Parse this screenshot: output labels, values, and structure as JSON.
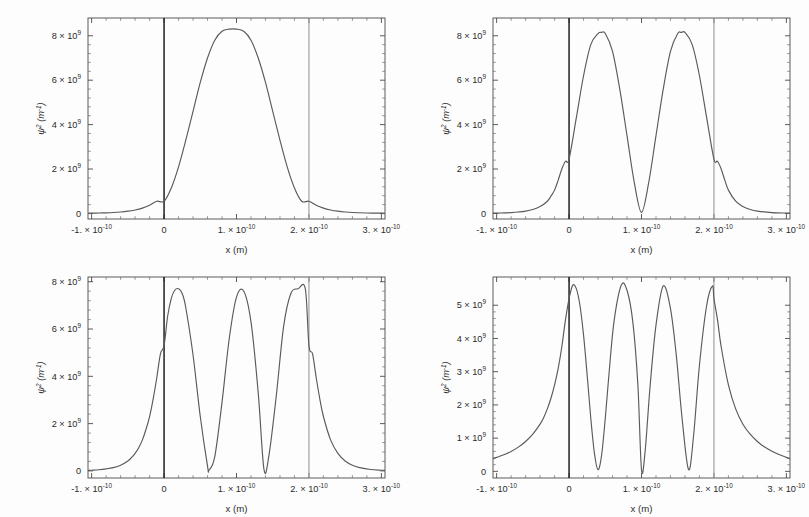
{
  "figure": {
    "background_color": "#fdfdfd",
    "curve_color": "#5a5a5a",
    "axis_color": "#4a4a4a",
    "well_wall_left_color": "#1f1f1f",
    "well_wall_right_color": "#9a9a9a",
    "rows": 2,
    "columns": 2
  },
  "axes": {
    "xlabel": "x (m)",
    "ylabel_base": "ψ",
    "ylabel_sup": "2",
    "ylabel_unit": "(m",
    "ylabel_unit_sup": "-1",
    "ylabel_unit_close": ")",
    "ylabel_full": "ψ² (m⁻¹)",
    "x_tick_labels": [
      "-1. × 10",
      "0",
      "1. × 10",
      "2. × 10",
      "3. × 10"
    ],
    "x_tick_exponents": [
      "-10",
      "",
      "-10",
      "-10",
      "-10"
    ],
    "x_tick_values": [
      -1e-10,
      0,
      1e-10,
      2e-10,
      3e-10
    ],
    "x_minor_per_interval": 4,
    "xlim": [
      -1.05e-10,
      3.05e-10
    ]
  },
  "chart_data": [
    {
      "id": "n1",
      "panel_position": "top-left",
      "type": "line",
      "title": "",
      "xlabel": "x (m)",
      "ylabel": "ψ² (m⁻¹)",
      "xlim": [
        -1.05e-10,
        3.05e-10
      ],
      "ylim": [
        -250000000.0,
        8800000000.0
      ],
      "grid": false,
      "legend": "none",
      "quantum_number": 1,
      "well_left_m": 0,
      "well_right_m": 2e-10,
      "peak_value": 8300000000.0,
      "peak_count": 1,
      "node_count": 0,
      "y_tick_labels": [
        "0",
        "2 × 10",
        "4 × 10",
        "6 × 10",
        "8 × 10"
      ],
      "y_tick_exponents": [
        "",
        "9",
        "9",
        "9",
        "9"
      ],
      "y_tick_values": [
        0,
        2000000000.0,
        4000000000.0,
        6000000000.0,
        8000000000.0
      ],
      "y_minor_per_interval": 4,
      "peaks_x_m": [
        1e-10
      ],
      "peaks_y": [
        8300000000.0
      ],
      "x": [
        -1.05e-10,
        -1e-10,
        -9e-11,
        -8e-11,
        -7e-11,
        -6e-11,
        -5e-11,
        -4e-11,
        -3e-11,
        -2e-11,
        -1e-11,
        0.0,
        1e-11,
        2e-11,
        3e-11,
        4e-11,
        5e-11,
        6e-11,
        7e-11,
        8e-11,
        9e-11,
        1e-10,
        1.1e-10,
        1.2e-10,
        1.3e-10,
        1.4e-10,
        1.5e-10,
        1.6e-10,
        1.7e-10,
        1.8e-10,
        1.9e-10,
        2e-10,
        2.1e-10,
        2.2e-10,
        2.3e-10,
        2.4e-10,
        2.5e-10,
        2.6e-10,
        2.8e-10,
        3e-10,
        3.05e-10
      ],
      "y": [
        10000000.0,
        12000000.0,
        18000000.0,
        28000000.0,
        43000000.0,
        66000000.0,
        102000000.0,
        157000000.0,
        240000000.0,
        370000000.0,
        550000000.0,
        550000000.0,
        1150000000.0,
        2100000000.0,
        3300000000.0,
        4600000000.0,
        5900000000.0,
        7000000000.0,
        7800000000.0,
        8200000000.0,
        8300000000.0,
        8300000000.0,
        8200000000.0,
        7800000000.0,
        7000000000.0,
        5900000000.0,
        4600000000.0,
        3300000000.0,
        2100000000.0,
        1150000000.0,
        550000000.0,
        550000000.0,
        370000000.0,
        240000000.0,
        157000000.0,
        102000000.0,
        66000000.0,
        43000000.0,
        22000000.0,
        12000000.0,
        10000000.0
      ]
    },
    {
      "id": "n2",
      "panel_position": "top-right",
      "type": "line",
      "title": "",
      "xlabel": "x (m)",
      "ylabel": "ψ² (m⁻¹)",
      "xlim": [
        -1.05e-10,
        3.05e-10
      ],
      "ylim": [
        -250000000.0,
        8800000000.0
      ],
      "grid": false,
      "legend": "none",
      "quantum_number": 2,
      "well_left_m": 0,
      "well_right_m": 2e-10,
      "peak_value": 8150000000.0,
      "peak_count": 2,
      "node_count": 1,
      "y_tick_labels": [
        "0",
        "2 × 10",
        "4 × 10",
        "6 × 10",
        "8 × 10"
      ],
      "y_tick_exponents": [
        "",
        "9",
        "9",
        "9",
        "9"
      ],
      "y_tick_values": [
        0,
        2000000000.0,
        4000000000.0,
        6000000000.0,
        8000000000.0
      ],
      "y_minor_per_interval": 4,
      "peaks_x_m": [
        4.5e-11,
        1.6e-10
      ],
      "peaks_y": [
        8150000000.0,
        8150000000.0
      ],
      "nodes_x_m": [
        1e-10
      ],
      "x": [
        -1.05e-10,
        -1e-10,
        -9e-11,
        -8e-11,
        -7e-11,
        -6e-11,
        -5e-11,
        -4e-11,
        -3e-11,
        -2.5e-11,
        -2e-11,
        -1.5e-11,
        -1e-11,
        -5e-12,
        0.0,
        1e-11,
        2e-11,
        3e-11,
        4e-11,
        4.5e-11,
        5e-11,
        6e-11,
        7e-11,
        8e-11,
        9e-11,
        1e-10,
        1.1e-10,
        1.2e-10,
        1.3e-10,
        1.4e-10,
        1.5e-10,
        1.55e-10,
        1.6e-10,
        1.7e-10,
        1.8e-10,
        1.9e-10,
        2e-10,
        2.05e-10,
        2.1e-10,
        2.15e-10,
        2.2e-10,
        2.3e-10,
        2.4e-10,
        2.5e-10,
        2.6e-10,
        2.8e-10,
        3e-10,
        3.05e-10
      ],
      "y": [
        12000000.0,
        15000000.0,
        25000000.0,
        40000000.0,
        65000000.0,
        105000000.0,
        180000000.0,
        310000000.0,
        550000000.0,
        780000000.0,
        1050000000.0,
        1500000000.0,
        2000000000.0,
        2350000000.0,
        2450000000.0,
        4300000000.0,
        6200000000.0,
        7600000000.0,
        8100000000.0,
        8150000000.0,
        8100000000.0,
        7300000000.0,
        5600000000.0,
        3500000000.0,
        1400000000.0,
        50000000.0,
        1400000000.0,
        3500000000.0,
        5600000000.0,
        7300000000.0,
        8100000000.0,
        8150000000.0,
        8150000000.0,
        7600000000.0,
        6200000000.0,
        4300000000.0,
        2450000000.0,
        2350000000.0,
        2000000000.0,
        1500000000.0,
        1050000000.0,
        550000000.0,
        310000000.0,
        180000000.0,
        105000000.0,
        40000000.0,
        15000000.0,
        12000000.0
      ]
    },
    {
      "id": "n3",
      "panel_position": "bottom-left",
      "type": "line",
      "title": "",
      "xlabel": "x (m)",
      "ylabel": "ψ² (m⁻¹)",
      "xlim": [
        -1.05e-10,
        3.05e-10
      ],
      "ylim": [
        -300000000.0,
        8200000000.0
      ],
      "grid": false,
      "legend": "none",
      "quantum_number": 3,
      "well_left_m": 0,
      "well_right_m": 2e-10,
      "peak_value": 7700000000.0,
      "peak_count": 3,
      "node_count": 2,
      "y_tick_labels": [
        "0",
        "2 × 10",
        "4 × 10",
        "6 × 10",
        "8 × 10"
      ],
      "y_tick_exponents": [
        "",
        "9",
        "9",
        "9",
        "9"
      ],
      "y_tick_values": [
        0,
        2000000000.0,
        4000000000.0,
        6000000000.0,
        8000000000.0
      ],
      "y_minor_per_interval": 4,
      "peaks_x_m": [
        2e-11,
        1e-10,
        1.95e-10
      ],
      "peaks_y": [
        7700000000.0,
        7700000000.0,
        7700000000.0
      ],
      "nodes_x_m": [
        6.2e-11,
        1.38e-10
      ],
      "x": [
        -1.05e-10,
        -1e-10,
        -9e-11,
        -8e-11,
        -7e-11,
        -6e-11,
        -5e-11,
        -4.5e-11,
        -4e-11,
        -3.5e-11,
        -3e-11,
        -2.5e-11,
        -2e-11,
        -1.5e-11,
        -1e-11,
        -5e-12,
        0.0,
        5e-12,
        1e-11,
        1.5e-11,
        2e-11,
        2.5e-11,
        3e-11,
        4e-11,
        5e-11,
        6e-11,
        6.2e-11,
        7e-11,
        8e-11,
        9e-11,
        1e-10,
        1.1e-10,
        1.2e-10,
        1.3e-10,
        1.38e-10,
        1.45e-10,
        1.55e-10,
        1.65e-10,
        1.75e-10,
        1.85e-10,
        1.95e-10,
        2e-10,
        2.05e-10,
        2.1e-10,
        2.15e-10,
        2.2e-10,
        2.3e-10,
        2.4e-10,
        2.5e-10,
        2.6e-10,
        2.7e-10,
        2.85e-10,
        3e-10,
        3.05e-10
      ],
      "y": [
        20000000.0,
        30000000.0,
        50000000.0,
        85000000.0,
        140000000.0,
        240000000.0,
        420000000.0,
        560000000.0,
        740000000.0,
        980000000.0,
        1300000000.0,
        1750000000.0,
        2300000000.0,
        3050000000.0,
        3950000000.0,
        4950000000.0,
        5300000000.0,
        6550000000.0,
        7300000000.0,
        7650000000.0,
        7700000000.0,
        7500000000.0,
        6900000000.0,
        4900000000.0,
        2300000000.0,
        200000000.0,
        30000000.0,
        600000000.0,
        2900000000.0,
        5600000000.0,
        7350000000.0,
        7600000000.0,
        6300000000.0,
        3300000000.0,
        50000000.0,
        700000000.0,
        3200000000.0,
        6100000000.0,
        7500000000.0,
        7700000000.0,
        7700000000.0,
        5300000000.0,
        4950000000.0,
        3950000000.0,
        3050000000.0,
        2300000000.0,
        1300000000.0,
        740000000.0,
        420000000.0,
        240000000.0,
        140000000.0,
        60000000.0,
        30000000.0,
        20000000.0
      ]
    },
    {
      "id": "n4",
      "panel_position": "bottom-right",
      "type": "line",
      "title": "",
      "xlabel": "x (m)",
      "ylabel": "ψ² (m⁻¹)",
      "xlim": [
        -1.05e-10,
        3.05e-10
      ],
      "ylim": [
        -200000000.0,
        5850000000.0
      ],
      "grid": false,
      "legend": "none",
      "quantum_number": 4,
      "well_left_m": 0,
      "well_right_m": 2e-10,
      "peak_value": 5600000000.0,
      "peak_count": 4,
      "node_count": 3,
      "y_tick_labels": [
        "0",
        "1 × 10",
        "2 × 10",
        "3 × 10",
        "4 × 10",
        "5 × 10"
      ],
      "y_tick_exponents": [
        "",
        "9",
        "9",
        "9",
        "9",
        "9"
      ],
      "y_tick_values": [
        0,
        1000000000.0,
        2000000000.0,
        3000000000.0,
        4000000000.0,
        5000000000.0
      ],
      "y_minor_per_interval": 4,
      "peaks_x_m": [
        5e-12,
        7.2e-11,
        1.3e-10,
        1.98e-10
      ],
      "peaks_y": [
        5600000000.0,
        5600000000.0,
        5580000000.0,
        5580000000.0
      ],
      "nodes_x_m": [
        4e-11,
        1e-10,
        1.65e-10
      ],
      "x": [
        -1.05e-10,
        -1e-10,
        -9e-11,
        -8e-11,
        -7e-11,
        -6e-11,
        -5e-11,
        -4e-11,
        -3.5e-11,
        -3e-11,
        -2.5e-11,
        -2e-11,
        -1.5e-11,
        -1e-11,
        -5e-12,
        0.0,
        5e-12,
        1e-11,
        1.5e-11,
        2e-11,
        2.5e-11,
        3e-11,
        3.5e-11,
        4e-11,
        4.5e-11,
        5e-11,
        5.5e-11,
        6.2e-11,
        7.2e-11,
        8e-11,
        8.8e-11,
        9.5e-11,
        1e-10,
        1.05e-10,
        1.12e-10,
        1.2e-10,
        1.3e-10,
        1.4e-10,
        1.48e-10,
        1.56e-10,
        1.65e-10,
        1.72e-10,
        1.8e-10,
        1.9e-10,
        1.98e-10,
        2e-10,
        2.05e-10,
        2.1e-10,
        2.2e-10,
        2.3e-10,
        2.4e-10,
        2.5e-10,
        2.6e-10,
        2.7e-10,
        2.85e-10,
        3e-10,
        3.05e-10
      ],
      "y": [
        380000000.0,
        420000000.0,
        500000000.0,
        600000000.0,
        730000000.0,
        900000000.0,
        1120000000.0,
        1420000000.0,
        1620000000.0,
        1880000000.0,
        2200000000.0,
        2600000000.0,
        3100000000.0,
        3750000000.0,
        4550000000.0,
        5200000000.0,
        5600000000.0,
        5500000000.0,
        5000000000.0,
        4100000000.0,
        2900000000.0,
        1600000000.0,
        550000000.0,
        50000000.0,
        500000000.0,
        1600000000.0,
        2900000000.0,
        4500000000.0,
        5600000000.0,
        5450000000.0,
        4500000000.0,
        2600000000.0,
        50000000.0,
        600000000.0,
        2600000000.0,
        4400000000.0,
        5580000000.0,
        4900000000.0,
        3500000000.0,
        1600000000.0,
        50000000.0,
        1100000000.0,
        3200000000.0,
        5000000000.0,
        5580000000.0,
        5200000000.0,
        4550000000.0,
        3750000000.0,
        2600000000.0,
        1880000000.0,
        1420000000.0,
        1120000000.0,
        900000000.0,
        730000000.0,
        550000000.0,
        420000000.0,
        380000000.0
      ]
    }
  ]
}
